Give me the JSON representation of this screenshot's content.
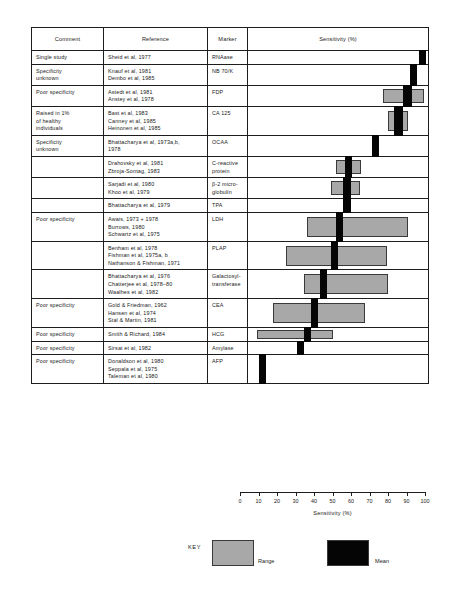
{
  "figure": {
    "axis_title": "Sensitivity (%)",
    "key_label": "KEY",
    "range_label": "Range",
    "mean_label": "Mean",
    "range_color": "#a8a8a8",
    "mean_color": "#050505"
  },
  "table": {
    "headers": {
      "comment": "Comment",
      "reference": "Reference",
      "marker": "Marker",
      "plot": "Sensitivity (%)"
    }
  },
  "chart_data": {
    "type": "bar",
    "title": "Sensitivity (%)",
    "xlabel": "Sensitivity (%)",
    "ylabel": "",
    "xlim": [
      0,
      100
    ],
    "ticks": [
      0,
      10,
      20,
      30,
      40,
      50,
      60,
      70,
      80,
      90,
      100
    ],
    "grid": false,
    "legend": [
      "Range",
      "Mean"
    ],
    "legend_position": "bottom",
    "rows": [
      {
        "comment": [
          "Single study"
        ],
        "reference": [
          "Sheid et al, 1977"
        ],
        "marker": [
          "RNAase"
        ],
        "range": null,
        "mean": [
          95,
          99
        ]
      },
      {
        "comment": [
          "Specificity",
          "unknown"
        ],
        "reference": [
          "Knauf et al, 1981",
          "Dembo et al, 1985"
        ],
        "marker": [
          "NB 70/K"
        ],
        "range": null,
        "mean": [
          90,
          94
        ]
      },
      {
        "comment": [
          "Poor specificity"
        ],
        "reference": [
          "Astedt et al, 1981",
          "Anstey et al, 1978"
        ],
        "marker": [
          "FDP"
        ],
        "range": [
          75,
          98
        ],
        "mean": [
          86,
          91
        ]
      },
      {
        "comment": [
          "Raised in 1%",
          "of healthy",
          "individuals"
        ],
        "reference": [
          "Bast et al, 1983",
          "Canney et al, 1985",
          "Heinonen et al, 1985"
        ],
        "marker": [
          "CA 125"
        ],
        "range": [
          78,
          89
        ],
        "mean": [
          81,
          86
        ]
      },
      {
        "comment": [
          "Specificity",
          "unknown"
        ],
        "reference": [
          "Bhattacharya et al, 1973a,b,",
          "1978"
        ],
        "marker": [
          "OCAA"
        ],
        "range": null,
        "mean": [
          69,
          73
        ]
      },
      {
        "comment": [],
        "reference": [
          "Drahovsky et al, 1981",
          "Zbroja-Sontag, 1983"
        ],
        "marker": [
          "C-reactive",
          "protein"
        ],
        "range": [
          49,
          63
        ],
        "mean": [
          54,
          58
        ]
      },
      {
        "comment": [],
        "reference": [
          "Sarjadi et al, 1980",
          "Khoo et al, 1979"
        ],
        "marker": [
          "β-2 micro-",
          "globulin"
        ],
        "range": [
          46,
          62
        ],
        "mean": [
          53,
          57
        ]
      },
      {
        "comment": [],
        "reference": [
          "Bhattacharya et al, 1979"
        ],
        "marker": [
          "TPA"
        ],
        "range": null,
        "mean": [
          53,
          57
        ]
      },
      {
        "comment": [
          "Poor specificity"
        ],
        "reference": [
          "Awais, 1973 + 1978",
          "Burrows, 1980",
          "Schwartz et al, 1975"
        ],
        "marker": [
          "LDH"
        ],
        "range": [
          33,
          89
        ],
        "mean": [
          49,
          53
        ]
      },
      {
        "comment": [],
        "reference": [
          "Benham et al, 1978",
          "Fishman et al, 1975a, b",
          "Nathanson & Fishman, 1971"
        ],
        "marker": [
          "PLAP"
        ],
        "range": [
          21,
          77
        ],
        "mean": [
          46,
          50
        ]
      },
      {
        "comment": [],
        "reference": [
          "Bhattacharya et al, 1976",
          "Chatterjee et al, 1978–80",
          "Waalhes et al, 1982"
        ],
        "marker": [
          "Galactosyl-",
          "transferase"
        ],
        "range": [
          31,
          78
        ],
        "mean": [
          40,
          44
        ]
      },
      {
        "comment": [
          "Poor specificity"
        ],
        "reference": [
          "Gold & Friedman, 1962",
          "Hansen et al, 1974",
          "Stal & Martin, 1981"
        ],
        "marker": [
          "CEA"
        ],
        "range": [
          14,
          65
        ],
        "mean": [
          35,
          39
        ]
      },
      {
        "comment": [
          "Poor specificity"
        ],
        "reference": [
          "Smith & Richard, 1984"
        ],
        "marker": [
          "HCG"
        ],
        "range": [
          5,
          47
        ],
        "mean": [
          31,
          35
        ]
      },
      {
        "comment": [
          "Poor specificity"
        ],
        "reference": [
          "Sirsat et al, 1982"
        ],
        "marker": [
          "Amylase"
        ],
        "range": null,
        "mean": [
          27,
          31
        ]
      },
      {
        "comment": [
          "Poor specificity"
        ],
        "reference": [
          "Donaldson et al, 1980",
          "Seppala et al, 1975",
          "Taleman et al, 1980"
        ],
        "marker": [
          "AFP"
        ],
        "range": null,
        "mean": [
          6,
          10
        ]
      }
    ]
  }
}
